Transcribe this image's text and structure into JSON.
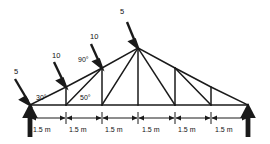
{
  "diagram": {
    "type": "truss-free-body-diagram",
    "stroke_color": "#1a1a1a",
    "background": "#ffffff",
    "span_total_m": 9.0,
    "nodes": {
      "bottom_chord": [
        {
          "id": "A",
          "x": 30,
          "y": 105
        },
        {
          "id": "B",
          "x": 66,
          "y": 105
        },
        {
          "id": "C",
          "x": 102,
          "y": 105
        },
        {
          "id": "D",
          "x": 138,
          "y": 105
        },
        {
          "id": "E",
          "x": 175,
          "y": 105
        },
        {
          "id": "F",
          "x": 211,
          "y": 105
        },
        {
          "id": "G",
          "x": 248,
          "y": 105
        }
      ],
      "top_chord": [
        {
          "id": "A",
          "x": 30,
          "y": 105
        },
        {
          "id": "H",
          "x": 66,
          "y": 87
        },
        {
          "id": "I",
          "x": 102,
          "y": 68
        },
        {
          "id": "J",
          "x": 138,
          "y": 48
        },
        {
          "id": "K",
          "x": 175,
          "y": 68
        },
        {
          "id": "L",
          "x": 211,
          "y": 87
        },
        {
          "id": "G",
          "x": 248,
          "y": 105
        }
      ]
    },
    "loads": [
      {
        "id": "load-left",
        "label": "5",
        "node": "A",
        "label_x": 14,
        "label_y": 68
      },
      {
        "id": "load-mid-left",
        "label": "10",
        "node": "H",
        "label_x": 52,
        "label_y": 52
      },
      {
        "id": "load-upper-left",
        "label": "10",
        "node": "I",
        "label_x": 90,
        "label_y": 33
      },
      {
        "id": "load-apex",
        "label": "5",
        "node": "J",
        "label_x": 120,
        "label_y": 8
      }
    ],
    "angles": [
      {
        "id": "angle-left-support",
        "label": "30°",
        "x": 36,
        "y": 94
      },
      {
        "id": "angle-node-c",
        "label": "50°",
        "x": 80,
        "y": 94
      },
      {
        "id": "angle-node-i",
        "label": "90°",
        "x": 78,
        "y": 56
      }
    ],
    "reactions": [
      {
        "id": "reaction-left",
        "node": "A",
        "direction": "up"
      },
      {
        "id": "reaction-right",
        "node": "G",
        "direction": "up"
      }
    ],
    "dimensions": {
      "line_y": 118,
      "label_y": 126,
      "segments": [
        {
          "label": "1.5 m",
          "x1": 30,
          "x2": 66
        },
        {
          "label": "1.5 m",
          "x1": 66,
          "x2": 102
        },
        {
          "label": "1.5 m",
          "x1": 102,
          "x2": 138
        },
        {
          "label": "1.5 m",
          "x1": 138,
          "x2": 175
        },
        {
          "label": "1.5 m",
          "x1": 175,
          "x2": 211
        },
        {
          "label": "1.5 m",
          "x1": 211,
          "x2": 248
        }
      ]
    }
  }
}
